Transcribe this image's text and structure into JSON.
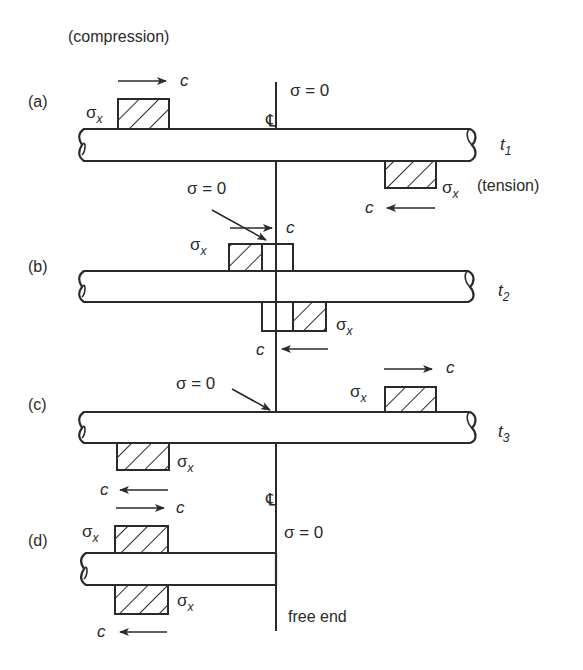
{
  "diagram": {
    "title_label": "(compression)",
    "tension_label": "(tension)",
    "free_end_label": "free end",
    "centerline_symbol": "℄",
    "sigma_zero": "σ = 0",
    "sigma": "σ",
    "sigma_sub": "x",
    "wave_speed": "c",
    "panels": [
      {
        "id": "a",
        "label": "(a)",
        "time": "t",
        "time_sub": "1"
      },
      {
        "id": "b",
        "label": "(b)",
        "time": "t",
        "time_sub": "2"
      },
      {
        "id": "c",
        "label": "(c)",
        "time": "t",
        "time_sub": "3"
      },
      {
        "id": "d",
        "label": "(d)"
      }
    ],
    "colors": {
      "ink": "#2a2a2a",
      "background": "#ffffff"
    }
  }
}
